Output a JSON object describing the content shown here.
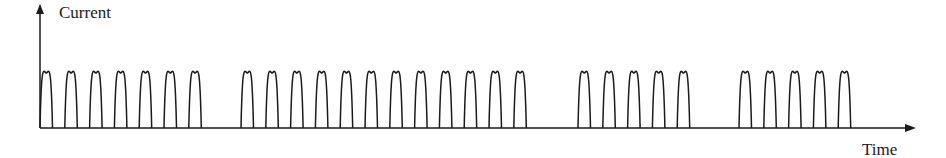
{
  "diagram": {
    "y_axis_label": "Current",
    "x_axis_label": "Time",
    "colors": {
      "stroke": "#1a1a1a",
      "background": "#ffffff"
    },
    "pulse_groups": [
      {
        "count": 7,
        "start_x": 40
      },
      {
        "count": 12,
        "start_x": 241
      },
      {
        "count": 5,
        "start_x": 578
      },
      {
        "count": 5,
        "start_x": 739
      }
    ],
    "pulse_period_px": 24.8,
    "pulse_width_px": 12.5,
    "baseline_y": 128,
    "peak_y": 73
  }
}
